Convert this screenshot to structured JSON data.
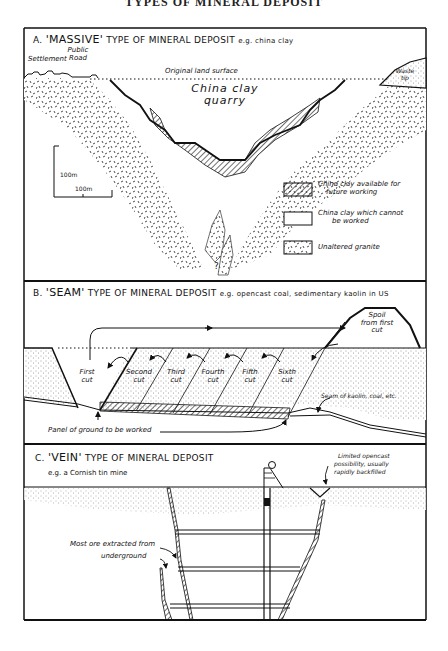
{
  "page": {
    "title": "TYPES OF MINERAL DEPOSIT"
  },
  "sectionA": {
    "letter": "A.",
    "type_word": "'MASSIVE'",
    "title_rest": "TYPE OF MINERAL DEPOSIT",
    "example": "e.g. china clay",
    "labels": {
      "settlement": "Settlement",
      "public_road_1": "Public",
      "public_road_2": "Road",
      "original_surface": "Original land surface",
      "waste_tip_1": "Waste",
      "waste_tip_2": "tip",
      "quarry_1": "China clay",
      "quarry_2": "quarry",
      "question": "?"
    },
    "scale": {
      "vertical": "100m",
      "horizontal": "100m"
    },
    "legend": [
      {
        "pattern": "hatched",
        "label_1": "China clay available for",
        "label_2": "future working"
      },
      {
        "pattern": "blank",
        "label_1": "China clay which cannot",
        "label_2": "be worked"
      },
      {
        "pattern": "granite",
        "label_1": "Unaltered granite",
        "label_2": ""
      }
    ]
  },
  "sectionB": {
    "letter": "B.",
    "type_word": "'SEAM'",
    "title_rest": "TYPE OF MINERAL DEPOSIT",
    "example": "e.g. opencast coal, sedimentary kaolin in US",
    "cuts": [
      {
        "l1": "First",
        "l2": "cut"
      },
      {
        "l1": "Second",
        "l2": "cut"
      },
      {
        "l1": "Third",
        "l2": "cut"
      },
      {
        "l1": "Fourth",
        "l2": "cut"
      },
      {
        "l1": "Fifth",
        "l2": "cut"
      },
      {
        "l1": "Sixth",
        "l2": "cut"
      }
    ],
    "spoil_1": "Spoil",
    "spoil_2": "from first",
    "spoil_3": "cut",
    "seam_label": "Seam of kaolin, coal, etc.",
    "panel_label": "Panel of ground to be worked"
  },
  "sectionC": {
    "letter": "C.",
    "type_word": "'VEIN'",
    "title_rest": "TYPE OF MINERAL DEPOSIT",
    "example": "e.g. a Cornish tin mine",
    "opencast_1": "Limited opencast",
    "opencast_2": "possibility, usually",
    "opencast_3": "rapidly backfilled",
    "underground_1": "Most ore extracted from",
    "underground_2": "underground"
  }
}
